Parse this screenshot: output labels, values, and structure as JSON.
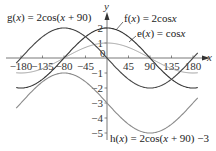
{
  "chart_data": {
    "type": "line",
    "title": "",
    "xlabel": "x",
    "ylabel": "y",
    "xlim": [
      -180,
      180
    ],
    "ylim": [
      -5,
      2
    ],
    "grid": false,
    "legend_position": "inline annotations",
    "x_ticks": [
      -180,
      -135,
      -90,
      -45,
      0,
      45,
      90,
      135,
      180
    ],
    "x_tick_labels": [
      "-180",
      "-135",
      "-80",
      "-45",
      "0",
      "45",
      "90",
      "135",
      "180"
    ],
    "y_ticks": [
      2,
      1,
      0,
      -1,
      -2,
      -3,
      -4,
      -5
    ],
    "y_tick_labels": [
      "2",
      "1",
      "0",
      "-1",
      "-2",
      "-3",
      "-4",
      "-5"
    ],
    "series": [
      {
        "name": "e(x) = cosx",
        "amplitude": 1,
        "phase_deg": 0,
        "vertical_shift": 0,
        "color": "#9a9a9a",
        "x": [
          -180,
          -135,
          -90,
          -45,
          0,
          45,
          90,
          135,
          180
        ],
        "values": [
          -1,
          -0.71,
          0,
          0.71,
          1,
          0.71,
          0,
          -0.71,
          -1
        ]
      },
      {
        "name": "f(x) = 2cosx",
        "amplitude": 2,
        "phase_deg": 0,
        "vertical_shift": 0,
        "color": "#333333",
        "x": [
          -180,
          -135,
          -90,
          -45,
          0,
          45,
          90,
          135,
          180
        ],
        "values": [
          -2,
          -1.41,
          0,
          1.41,
          2,
          1.41,
          0,
          -1.41,
          -2
        ]
      },
      {
        "name": "g(x) = 2cos(x + 90)",
        "amplitude": 2,
        "phase_deg": 90,
        "vertical_shift": 0,
        "color": "#444444",
        "x": [
          -180,
          -135,
          -90,
          -45,
          0,
          45,
          90,
          135,
          180
        ],
        "values": [
          0,
          1.41,
          2,
          1.41,
          0,
          -1.41,
          -2,
          -1.41,
          0
        ]
      },
      {
        "name": "h(x) = 2cos(x + 90) −3",
        "amplitude": 2,
        "phase_deg": 90,
        "vertical_shift": -3,
        "color": "#8a8a8a",
        "x": [
          -180,
          -135,
          -90,
          -45,
          0,
          45,
          90,
          135,
          180
        ],
        "values": [
          -3,
          -1.59,
          -1,
          -1.59,
          -3,
          -4.41,
          -5,
          -4.41,
          -3
        ]
      }
    ],
    "annotations": [
      {
        "text": "g(x) = 2cos(x + 90)",
        "series": "g"
      },
      {
        "text": "f(x) = 2cosx",
        "series": "f"
      },
      {
        "text": "e(x) = cosx",
        "series": "e"
      },
      {
        "text": "h(x) = 2cos(x + 90) −3",
        "series": "h"
      }
    ]
  },
  "labels": {
    "g": {
      "name": "g",
      "x": "x",
      "rest": "= 2cos(",
      "x2": "x",
      "tail": " + 90)"
    },
    "f": {
      "name": "f(",
      "x": "x",
      "rest": ") = 2cos",
      "x2": "x"
    },
    "e": {
      "name": "e(",
      "x": "x",
      "rest": ") = cos",
      "x2": "x"
    },
    "h": {
      "name": "h(",
      "x": "x",
      "rest": ") = 2cos(",
      "x2": "x",
      "tail": " + 90) −3"
    },
    "axis_x": "x",
    "axis_y": "y"
  },
  "layout": {
    "origin_px": [
      107,
      58
    ],
    "px_per_degree": 0.4778,
    "px_per_unit": 15
  }
}
